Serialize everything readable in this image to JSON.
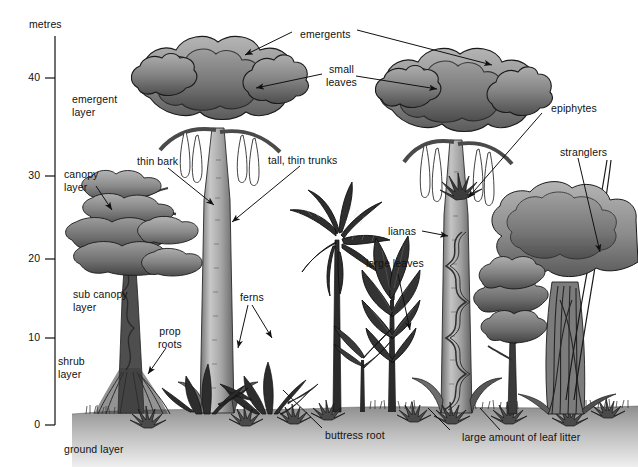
{
  "diagram": {
    "background_color": "#ffffff",
    "ink_color": "#111111"
  },
  "axis": {
    "unit_label": "metres",
    "ticks": [
      {
        "value": "40",
        "y": 78
      },
      {
        "value": "30",
        "y": 176
      },
      {
        "value": "20",
        "y": 259
      },
      {
        "value": "10",
        "y": 338
      },
      {
        "value": "0",
        "y": 425
      }
    ],
    "line_x": 55,
    "line_top": 36,
    "line_bottom": 425,
    "tick_len": 10
  },
  "layers": [
    {
      "name": "emergent-layer",
      "label": "emergent\nlayer",
      "x": 72,
      "y": 93
    },
    {
      "name": "canopy-layer",
      "label": "canopy\nlayer",
      "x": 64,
      "y": 168
    },
    {
      "name": "sub-canopy-layer",
      "label": "sub canopy\nlayer",
      "x": 73,
      "y": 288
    },
    {
      "name": "shrub-layer",
      "label": "shrub\nlayer",
      "x": 58,
      "y": 355
    },
    {
      "name": "ground-layer",
      "label": "ground layer",
      "x": 64,
      "y": 443
    }
  ],
  "callouts": [
    {
      "name": "emergents",
      "label": "emergents",
      "x": 300,
      "y": 28
    },
    {
      "name": "small-leaves",
      "label": "small\nleaves",
      "x": 331,
      "y": 63
    },
    {
      "name": "thin-bark",
      "label": "thin bark",
      "x": 137,
      "y": 155
    },
    {
      "name": "tall-thin-trunks",
      "label": "tall, thin trunks",
      "x": 268,
      "y": 154
    },
    {
      "name": "epiphytes",
      "label": "epiphytes",
      "x": 551,
      "y": 102
    },
    {
      "name": "stranglers",
      "label": "stranglers",
      "x": 562,
      "y": 146
    },
    {
      "name": "lianas",
      "label": "lianas",
      "x": 394,
      "y": 228
    },
    {
      "name": "large-leaves",
      "label": "large leaves",
      "x": 372,
      "y": 263
    },
    {
      "name": "ferns",
      "label": "ferns",
      "x": 244,
      "y": 295
    },
    {
      "name": "prop-roots",
      "label": "prop\nroots",
      "x": 163,
      "y": 330
    },
    {
      "name": "buttress-root",
      "label": "buttress root",
      "x": 329,
      "y": 433
    },
    {
      "name": "large-amount-leaf-litter",
      "label": "large amount of leaf litter",
      "x": 470,
      "y": 436
    }
  ],
  "colors": {
    "foliage_light": "#a9a9a9",
    "foliage_mid": "#8a8a8a",
    "foliage_dark": "#595959",
    "foliage_darkest": "#3b3b3b",
    "trunk_light": "#c2c2c2",
    "trunk_mid": "#9a9a9a",
    "trunk_dark": "#6d6d6d",
    "ground_top": "#8e8e8e",
    "ground_bottom": "#e8e8e8",
    "outline": "#1a1a1a"
  }
}
